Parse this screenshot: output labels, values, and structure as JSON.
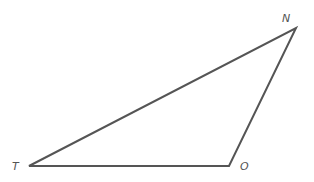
{
  "diagram": {
    "type": "triangle",
    "stroke_color": "#555555",
    "vertices": [
      {
        "label": "T",
        "x": 29,
        "y": 166
      },
      {
        "label": "O",
        "x": 229,
        "y": 166
      },
      {
        "label": "N",
        "x": 296,
        "y": 28
      }
    ],
    "labels": {
      "T": "T",
      "O": "O",
      "N": "N"
    }
  }
}
